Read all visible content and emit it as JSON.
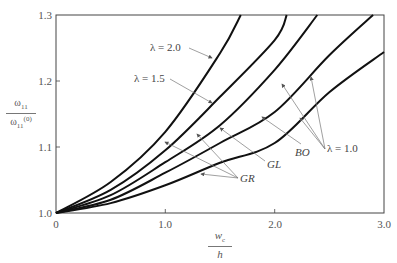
{
  "chart_data": {
    "type": "line",
    "title": "",
    "xlabel": "w_c / h",
    "ylabel": "ω11 / ω11^(0)",
    "xlim": [
      0,
      3.0
    ],
    "ylim": [
      1.0,
      1.3
    ],
    "grid": false,
    "x_ticks": [
      "0",
      "1.0",
      "2.0",
      "3.0"
    ],
    "y_ticks": [
      "1.0",
      "1.1",
      "1.2",
      "1.3"
    ],
    "series": [
      {
        "name": "GR, λ = 2.0",
        "x": [
          0,
          0.5,
          1.0,
          1.5,
          1.69
        ],
        "values": [
          1.0,
          1.047,
          1.123,
          1.242,
          1.3
        ]
      },
      {
        "name": "GR, λ = 1.5",
        "x": [
          0,
          0.5,
          1.0,
          1.5,
          2.0,
          2.11
        ],
        "values": [
          1.0,
          1.035,
          1.095,
          1.176,
          1.262,
          1.3
        ]
      },
      {
        "name": "GL, λ = 1.0",
        "x": [
          0,
          0.5,
          1.0,
          1.5,
          2.0,
          2.39
        ],
        "values": [
          1.0,
          1.027,
          1.077,
          1.133,
          1.217,
          1.3
        ]
      },
      {
        "name": "BO, λ = 1.0",
        "x": [
          0,
          0.5,
          1.0,
          1.5,
          2.0,
          2.5,
          2.9
        ],
        "values": [
          1.0,
          1.02,
          1.061,
          1.106,
          1.153,
          1.239,
          1.3
        ]
      },
      {
        "name": "GR, λ = 1.0",
        "x": [
          0,
          0.5,
          1.0,
          1.5,
          2.0,
          2.5,
          3.0
        ],
        "values": [
          1.0,
          1.015,
          1.042,
          1.076,
          1.106,
          1.183,
          1.244
        ]
      }
    ],
    "annotations": [
      {
        "text": "λ = 2.0",
        "points_to": [
          "GR, λ = 2.0"
        ]
      },
      {
        "text": "λ = 1.5",
        "points_to": [
          "GR, λ = 1.5"
        ]
      },
      {
        "text": "λ = 1.0",
        "points_to": [
          "GL, λ = 1.0",
          "BO, λ = 1.0",
          "GR, λ = 1.0"
        ]
      },
      {
        "text": "GR",
        "points_to": [
          "GR, λ = 2.0",
          "GR, λ = 1.5",
          "GR, λ = 1.0"
        ]
      },
      {
        "text": "GL",
        "points_to": [
          "GL, λ = 1.0"
        ]
      },
      {
        "text": "BO",
        "points_to": [
          "BO, λ = 1.0"
        ]
      }
    ]
  },
  "axes": {
    "x_ticks": [
      "0",
      "1.0",
      "2.0",
      "3.0"
    ],
    "y_ticks": [
      "1.0",
      "1.1",
      "1.2",
      "1.3"
    ],
    "xlabel_num": "w",
    "xlabel_num_sub": "c",
    "xlabel_den": "h",
    "ylabel_num": "ω",
    "ylabel_num_sub": "11",
    "ylabel_den": "ω",
    "ylabel_den_sub": "11",
    "ylabel_den_sup": "(0)"
  },
  "labels": {
    "lambda_20": "λ = 2.0",
    "lambda_15": "λ = 1.5",
    "lambda_10": "λ = 1.0",
    "gr": "GR",
    "gl": "GL",
    "bo": "BO"
  },
  "colors": {
    "curve": "#111111",
    "frame": "#444444",
    "arrow": "#777777",
    "text": "#555555"
  }
}
